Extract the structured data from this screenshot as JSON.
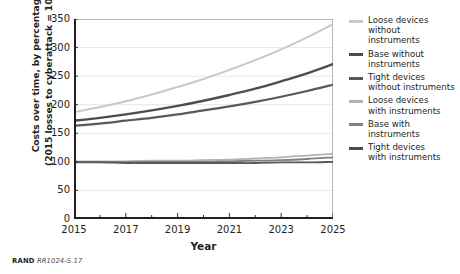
{
  "chart_data": {
    "type": "line",
    "title": "",
    "xlabel": "Year",
    "ylabel_line1": "Costs over time, by percentage",
    "ylabel_line2": "(2015 losses to cyberattack = 100%)",
    "xlim": [
      2015,
      2025
    ],
    "ylim": [
      0,
      350
    ],
    "xticks": [
      2015,
      2017,
      2019,
      2021,
      2023,
      2025
    ],
    "xticks_minor": [
      2016,
      2018,
      2020,
      2022,
      2024
    ],
    "yticks": [
      0,
      50,
      100,
      150,
      200,
      250,
      300,
      350
    ],
    "grid": "horizontal",
    "legend_position": "right",
    "x": [
      2015,
      2016,
      2017,
      2018,
      2019,
      2020,
      2021,
      2022,
      2023,
      2024,
      2025
    ],
    "series": [
      {
        "name": "Loose devices without instruments",
        "color": "#c8c8c8",
        "width": 2.0,
        "values": [
          187,
          196,
          206,
          218,
          231,
          245,
          261,
          278,
          297,
          318,
          341
        ]
      },
      {
        "name": "Base without instruments",
        "color": "#4d4d4d",
        "width": 2.4,
        "values": [
          172,
          177,
          183,
          190,
          198,
          207,
          217,
          228,
          241,
          255,
          271
        ]
      },
      {
        "name": "Tight devices without instruments",
        "color": "#595959",
        "width": 2.2,
        "values": [
          163,
          167,
          172,
          177,
          183,
          190,
          197,
          205,
          214,
          224,
          235
        ]
      },
      {
        "name": "Loose devices with instruments",
        "color": "#b3b3b3",
        "width": 1.8,
        "values": [
          101,
          101,
          101,
          102,
          102,
          103,
          104,
          106,
          108,
          111,
          114
        ]
      },
      {
        "name": "Base with instruments",
        "color": "#808080",
        "width": 1.8,
        "values": [
          100,
          100,
          100,
          100,
          100,
          100,
          101,
          102,
          103,
          105,
          108
        ]
      },
      {
        "name": "Tight devices with instruments",
        "color": "#595959",
        "width": 1.8,
        "values": [
          99,
          99,
          98,
          98,
          98,
          98,
          98,
          98,
          99,
          99,
          100
        ]
      }
    ]
  },
  "legend": {
    "items": [
      {
        "label": "Loose devices\nwithout\ninstruments",
        "color": "#c8c8c8"
      },
      {
        "label": "Base without\ninstruments",
        "color": "#4d4d4d"
      },
      {
        "label": "Tight devices\nwithout instruments",
        "color": "#595959"
      },
      {
        "label": "Loose devices\nwith instruments",
        "color": "#b3b3b3"
      },
      {
        "label": "Base with\ninstruments",
        "color": "#808080"
      },
      {
        "label": "Tight devices\nwith instruments",
        "color": "#4d4d4d"
      }
    ]
  },
  "source": {
    "brand": "RAND",
    "ref": "RR1024-S.17"
  },
  "axes": {
    "ytitle_line1": "Costs over time, by percentage",
    "ytitle_line2": "(2015 losses to cyberattack = 100%)",
    "xtitle": "Year"
  }
}
